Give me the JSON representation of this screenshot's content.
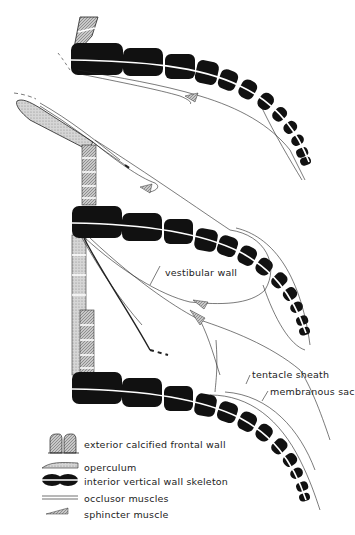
{
  "figure": {
    "labels": {
      "vestibular_wall": "vestibular wall",
      "tentacle_sheath": "tentacle sheath",
      "membranous_sac": "membranous sac"
    },
    "legend": [
      {
        "icon": "frontal-wall-swatch",
        "label": "exterior calcified frontal wall"
      },
      {
        "icon": "operculum-swatch",
        "label": "operculum"
      },
      {
        "icon": "vertical-wall-swatch",
        "label": "interior vertical wall skeleton"
      },
      {
        "icon": "occlusor-muscle-swatch",
        "label": "occlusor muscles"
      },
      {
        "icon": "sphincter-muscle-swatch",
        "label": "sphincter muscle"
      }
    ],
    "colors": {
      "ink": "#111111",
      "stipple": "#bdbdbd",
      "background": "#ffffff"
    }
  }
}
